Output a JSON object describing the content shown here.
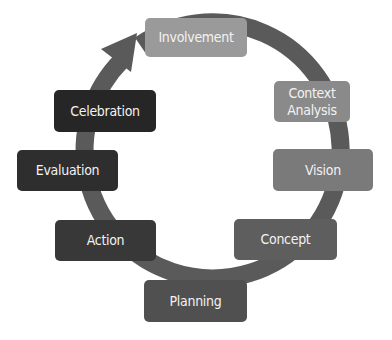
{
  "diagram": {
    "type": "cycle",
    "ring_color": "#5a5a5a",
    "steps": [
      {
        "label": "Involvement",
        "color": "#9a9a9a"
      },
      {
        "label": "Context\nAnalysis",
        "color": "#8a8a8a"
      },
      {
        "label": "Vision",
        "color": "#7a7a7a"
      },
      {
        "label": "Concept",
        "color": "#5e5e5e"
      },
      {
        "label": "Planning",
        "color": "#505050"
      },
      {
        "label": "Action",
        "color": "#383838"
      },
      {
        "label": "Evaluation",
        "color": "#2e2e2e"
      },
      {
        "label": "Celebration",
        "color": "#262626"
      }
    ]
  }
}
